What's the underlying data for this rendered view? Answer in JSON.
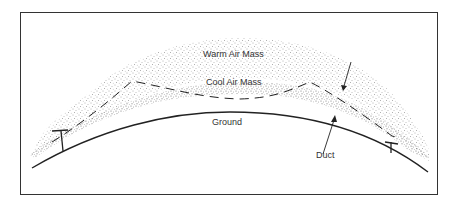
{
  "diagram": {
    "labels": {
      "warm": "Warm Air Mass",
      "cool": "Cool Air Mass",
      "ground": "Ground",
      "duct": "Duct"
    },
    "colors": {
      "line": "#222222",
      "stipple": "#555555",
      "text": "#333333",
      "frame": "#333333",
      "background": "#ffffff"
    }
  }
}
